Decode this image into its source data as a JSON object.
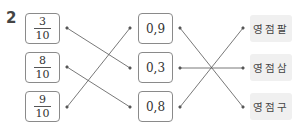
{
  "problem_number": "2",
  "left_column": [
    {
      "numerator": "3",
      "denominator": "10"
    },
    {
      "numerator": "8",
      "denominator": "10"
    },
    {
      "numerator": "9",
      "denominator": "10"
    }
  ],
  "middle_column": [
    "0,9",
    "0,3",
    "0,8"
  ],
  "right_column": [
    "영점팔",
    "영점삼",
    "영점구"
  ],
  "connections_left_to_middle": [
    {
      "from": "3/10",
      "to": "0,3"
    },
    {
      "from": "8/10",
      "to": "0,8"
    },
    {
      "from": "9/10",
      "to": "0,9"
    }
  ],
  "connections_middle_to_right": [
    {
      "from": "0,9",
      "to": "영점구"
    },
    {
      "from": "0,3",
      "to": "영점삼"
    },
    {
      "from": "0,8",
      "to": "영점팔"
    }
  ],
  "colors": {
    "line": "#555555",
    "box_border": "#8a8a8a",
    "label_fill": "#f0f0f0"
  }
}
